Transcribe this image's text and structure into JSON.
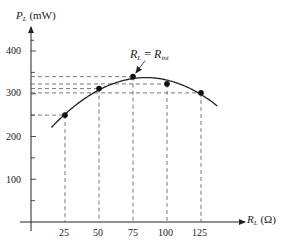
{
  "chart_data": {
    "type": "line",
    "title": "",
    "xlabel": "R_L (Ω)",
    "ylabel": "P_L (mW)",
    "x": [
      25,
      50,
      75,
      100,
      125
    ],
    "series": [
      {
        "name": "P_L",
        "values": [
          250,
          312,
          340,
          323,
          302
        ]
      }
    ],
    "xticks": [
      25,
      50,
      75,
      100,
      125
    ],
    "yticks": [
      100,
      200,
      300,
      400
    ],
    "xlim": [
      0,
      150
    ],
    "ylim": [
      0,
      440
    ],
    "grid": false,
    "legend": null,
    "annotations": [
      {
        "text": "R_L = R_int",
        "points_to": {
          "x": 75,
          "y": 340
        }
      }
    ],
    "dashed_guides": true
  },
  "labels": {
    "y_axis_main": "P",
    "y_axis_sub": "L",
    "y_axis_unit": " (mW)",
    "x_axis_main": "R",
    "x_axis_sub": "L",
    "x_axis_unit": " (Ω)",
    "annotation_lhs": "R",
    "annotation_lhs_sub": "L",
    "annotation_eq": " = ",
    "annotation_rhs": "R",
    "annotation_rhs_sub": "int"
  },
  "ytick_labels": [
    "400",
    "300",
    "200",
    "100"
  ],
  "xtick_labels": [
    "25",
    "50",
    "75",
    "100",
    "125"
  ]
}
